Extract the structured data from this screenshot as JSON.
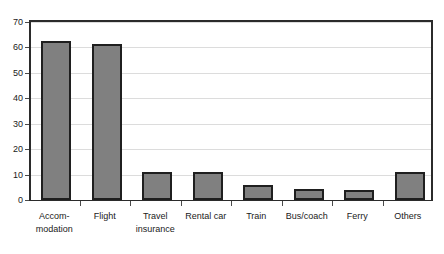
{
  "chart_data": {
    "type": "bar",
    "title": "",
    "subtitle": "",
    "xlabel": "",
    "ylabel": "",
    "ylim": [
      0,
      70
    ],
    "ytick_step": 10,
    "yticks": [
      "70",
      "60",
      "50",
      "40",
      "30",
      "20",
      "10",
      "0"
    ],
    "grid": true,
    "legend": null,
    "categories": [
      "Accom-\nmodation",
      "Flight",
      "Travel\ninsurance",
      "Rental car",
      "Train",
      "Bus/coach",
      "Ferry",
      "Others"
    ],
    "category_lines": [
      [
        "Accom-",
        "modation"
      ],
      [
        "Flight",
        ""
      ],
      [
        "Travel",
        "insurance"
      ],
      [
        "Rental car",
        ""
      ],
      [
        "Train",
        ""
      ],
      [
        "Bus/coach",
        ""
      ],
      [
        "Ferry",
        ""
      ],
      [
        "Others",
        ""
      ]
    ],
    "values": [
      62.5,
      61.5,
      11,
      11,
      6,
      4.5,
      4,
      11
    ],
    "bar_fill": "#808080",
    "bar_border": "#1f1f1f",
    "gridline_color": "#dcdcdc",
    "axis_color": "#2b2b2b",
    "background": "#ffffff"
  }
}
